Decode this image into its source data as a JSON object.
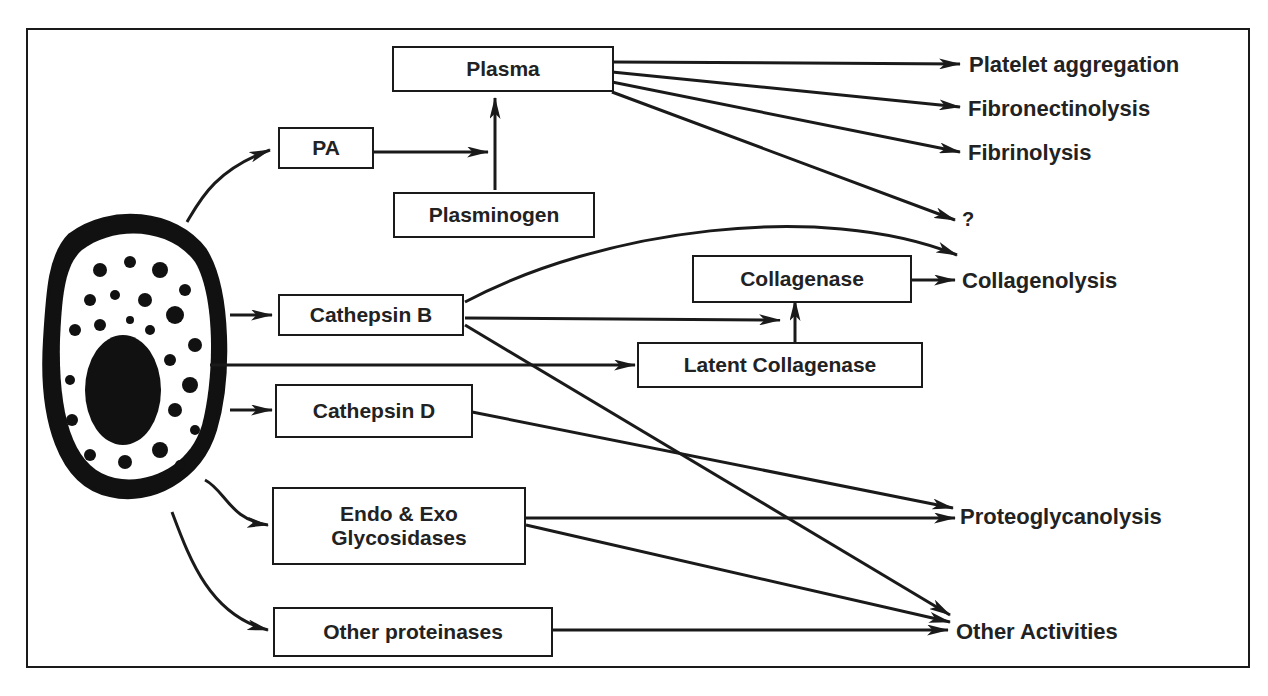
{
  "diagram": {
    "source": "cell",
    "boxes": {
      "plasma": "Plasma",
      "pa": "PA",
      "plasminogen": "Plasminogen",
      "cathepsin_b": "Cathepsin B",
      "collagenase": "Collagenase",
      "latent_collagenase": "Latent Collagenase",
      "cathepsin_d": "Cathepsin D",
      "glycosidases_line1": "Endo & Exo",
      "glycosidases_line2": "Glycosidases",
      "other_proteinases": "Other proteinases"
    },
    "outcomes": {
      "platelet": "Platelet aggregation",
      "fibronectinolysis": "Fibronectinolysis",
      "fibrinolysis": "Fibrinolysis",
      "unknown": "?",
      "collagenolysis": "Collagenolysis",
      "proteoglycanolysis": "Proteoglycanolysis",
      "other_activities": "Other Activities"
    },
    "colors": {
      "ink": "#1a1a1a",
      "background": "#ffffff"
    }
  }
}
